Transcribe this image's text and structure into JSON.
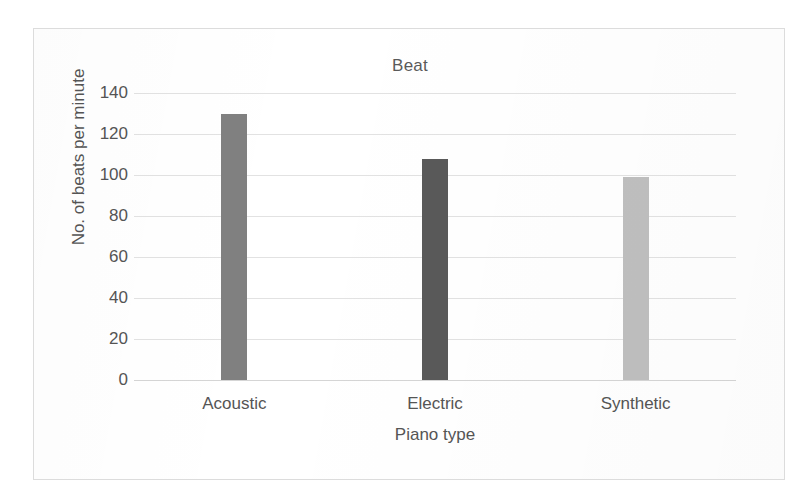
{
  "chart_data": {
    "type": "bar",
    "title": "Beat",
    "xlabel": "Piano type",
    "ylabel": "No. of beats per minute",
    "categories": [
      "Acoustic",
      "Electric",
      "Synthetic"
    ],
    "values": [
      130,
      108,
      99
    ],
    "ylim": [
      0,
      140
    ],
    "yticks": [
      0,
      20,
      40,
      60,
      80,
      100,
      120,
      140
    ],
    "ytick_labels": [
      "0",
      "20",
      "40",
      "60",
      "80",
      "100",
      "120",
      "140"
    ],
    "grid": true,
    "legend": "none",
    "bar_colors": [
      "#808080",
      "#595959",
      "#bfbfbf"
    ]
  },
  "colors": {
    "frame_border": "#dcdcdc",
    "gridline": "#e2e2e2",
    "baseline": "#d5d5d5",
    "text": "#555555",
    "title_text": "#5a5a5a",
    "background": "#ffffff"
  }
}
